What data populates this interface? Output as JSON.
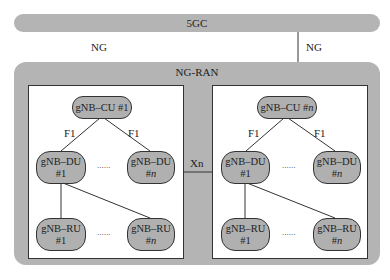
{
  "core": {
    "label": "5GC"
  },
  "interfaces": {
    "ng_left": "NG",
    "ng_right": "NG",
    "xn": "Xn"
  },
  "ran": {
    "title": "NG-RAN"
  },
  "gnbs": [
    {
      "cu": {
        "name": "gNB–CU",
        "index": "#1"
      },
      "f1_left": "F1",
      "f1_right": "F1",
      "dus": [
        {
          "name": "gNB–DU",
          "index": "#1"
        },
        {
          "name": "gNB–DU",
          "index": "#n"
        }
      ],
      "rus": [
        {
          "name": "gNB–RU",
          "index": "#1"
        },
        {
          "name": "gNB–RU",
          "index": "#n"
        }
      ],
      "ellipsis": "......"
    },
    {
      "cu": {
        "name": "gNB–CU",
        "index": "#n"
      },
      "f1_left": "F1",
      "f1_right": "F1",
      "dus": [
        {
          "name": "gNB–DU",
          "index": "#1"
        },
        {
          "name": "gNB–DU",
          "index": "#n"
        }
      ],
      "rus": [
        {
          "name": "gNB–RU",
          "index": "#1"
        },
        {
          "name": "gNB–RU",
          "index": "#n"
        }
      ],
      "ellipsis": "......"
    }
  ]
}
